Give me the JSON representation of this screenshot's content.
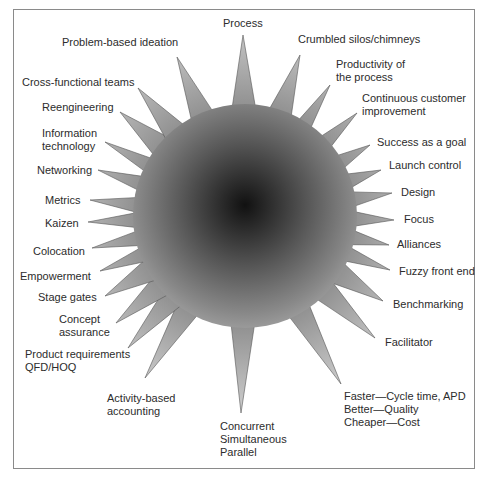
{
  "diagram": {
    "type": "starburst",
    "center": {
      "x": 245,
      "y": 216,
      "r": 112
    },
    "colors": {
      "center": "#111111",
      "edge": "#9a9a9a",
      "spike_tip": "#c8c8c8",
      "outline": "#555555",
      "frame": "#8a8a8a"
    },
    "spikes": [
      {
        "id": "process",
        "lines": [
          "Process"
        ],
        "tip": [
          243,
          35
        ],
        "label_pos": [
          223,
          17
        ]
      },
      {
        "id": "crumbled-silos",
        "lines": [
          "Crumbled silos/chimneys"
        ],
        "tip": [
          300,
          55
        ],
        "label_pos": [
          298,
          33
        ]
      },
      {
        "id": "productivity",
        "lines": [
          "Productivity of",
          "the process"
        ],
        "tip": [
          330,
          85
        ],
        "label_pos": [
          336,
          58
        ]
      },
      {
        "id": "continuous-customer",
        "lines": [
          "Continuous customer",
          "improvement"
        ],
        "tip": [
          357,
          113
        ],
        "label_pos": [
          362,
          92
        ]
      },
      {
        "id": "success-goal",
        "lines": [
          "Success as a goal"
        ],
        "tip": [
          370,
          145
        ],
        "label_pos": [
          377,
          136
        ]
      },
      {
        "id": "launch-control",
        "lines": [
          "Launch control"
        ],
        "tip": [
          381,
          170
        ],
        "label_pos": [
          389,
          159
        ]
      },
      {
        "id": "design",
        "lines": [
          "Design"
        ],
        "tip": [
          392,
          193
        ],
        "label_pos": [
          401,
          186
        ]
      },
      {
        "id": "focus",
        "lines": [
          "Focus"
        ],
        "tip": [
          394,
          220
        ],
        "label_pos": [
          404,
          213
        ]
      },
      {
        "id": "alliances",
        "lines": [
          "Alliances"
        ],
        "tip": [
          389,
          245
        ],
        "label_pos": [
          397,
          238
        ]
      },
      {
        "id": "fuzzy-front-end",
        "lines": [
          "Fuzzy front end"
        ],
        "tip": [
          390,
          270
        ],
        "label_pos": [
          399,
          265
        ]
      },
      {
        "id": "benchmarking",
        "lines": [
          "Benchmarking"
        ],
        "tip": [
          383,
          301
        ],
        "label_pos": [
          393,
          298
        ]
      },
      {
        "id": "facilitator",
        "lines": [
          "Facilitator"
        ],
        "tip": [
          375,
          338
        ],
        "label_pos": [
          385,
          336
        ]
      },
      {
        "id": "faster-better-cheaper",
        "lines": [
          "Faster—Cycle time, APD",
          "Better—Quality",
          "Cheaper—Cost"
        ],
        "tip": [
          341,
          384
        ],
        "label_pos": [
          344,
          390
        ]
      },
      {
        "id": "concurrent",
        "lines": [
          "Concurrent",
          "Simultaneous",
          "Parallel"
        ],
        "tip": [
          241,
          413
        ],
        "label_pos": [
          220,
          420
        ]
      },
      {
        "id": "activity-based",
        "lines": [
          "Activity-based",
          "accounting"
        ],
        "tip": [
          145,
          378
        ],
        "label_pos": [
          107,
          392
        ]
      },
      {
        "id": "product-requirements",
        "lines": [
          "Product requirements",
          "QFD/HOQ"
        ],
        "tip": [
          128,
          348
        ],
        "label_pos": [
          25,
          348
        ]
      },
      {
        "id": "concept-assurance",
        "lines": [
          "Concept",
          "assurance"
        ],
        "tip": [
          116,
          323
        ],
        "label_pos": [
          59,
          313
        ]
      },
      {
        "id": "stage-gates",
        "lines": [
          "Stage gates"
        ],
        "tip": [
          105,
          296
        ],
        "label_pos": [
          38,
          291
        ]
      },
      {
        "id": "empowerment",
        "lines": [
          "Empowerment"
        ],
        "tip": [
          100,
          271
        ],
        "label_pos": [
          20,
          270
        ]
      },
      {
        "id": "colocation",
        "lines": [
          "Colocation"
        ],
        "tip": [
          92,
          248
        ],
        "label_pos": [
          33,
          245
        ]
      },
      {
        "id": "kaizen",
        "lines": [
          "Kaizen"
        ],
        "tip": [
          88,
          222
        ],
        "label_pos": [
          45,
          217
        ]
      },
      {
        "id": "metrics",
        "lines": [
          "Metrics"
        ],
        "tip": [
          90,
          200
        ],
        "label_pos": [
          45,
          194
        ]
      },
      {
        "id": "networking",
        "lines": [
          "Networking"
        ],
        "tip": [
          98,
          170
        ],
        "label_pos": [
          37,
          164
        ]
      },
      {
        "id": "information-technology",
        "lines": [
          "Information",
          "technology"
        ],
        "tip": [
          105,
          142
        ],
        "label_pos": [
          42,
          127
        ]
      },
      {
        "id": "reengineering",
        "lines": [
          "Reengineering"
        ],
        "tip": [
          120,
          112
        ],
        "label_pos": [
          42,
          101
        ]
      },
      {
        "id": "cross-functional",
        "lines": [
          "Cross-functional teams"
        ],
        "tip": [
          138,
          88
        ],
        "label_pos": [
          22,
          76
        ]
      },
      {
        "id": "problem-based",
        "lines": [
          "Problem-based ideation"
        ],
        "tip": [
          177,
          57
        ],
        "label_pos": [
          62,
          36
        ]
      }
    ]
  }
}
